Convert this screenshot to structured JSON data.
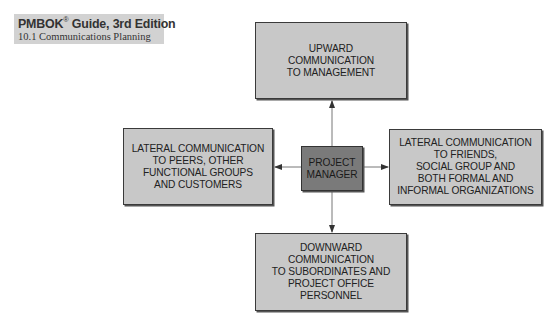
{
  "header": {
    "title": "PMBOK",
    "title_reg": "®",
    "title_rest": " Guide, 3rd Edition",
    "subtitle": "10.1 Communications Planning"
  },
  "diagram": {
    "center": "PROJECT\nMANAGER",
    "top": "UPWARD\nCOMMUNICATION\nTO MANAGEMENT",
    "left": "LATERAL COMMUNICATION\nTO PEERS, OTHER\nFUNCTIONAL GROUPS\nAND CUSTOMERS",
    "right": "LATERAL COMMUNICATION\nTO FRIENDS,\nSOCIAL GROUP AND\nBOTH FORMAL AND\nINFORMAL ORGANIZATIONS",
    "bottom": "DOWNWARD\nCOMMUNICATION\nTO SUBORDINATES AND\nPROJECT OFFICE\nPERSONNEL",
    "colors": {
      "box_fill": "#c8c8c8",
      "center_fill": "#7a7a7a",
      "border": "#3a3a3a"
    }
  }
}
